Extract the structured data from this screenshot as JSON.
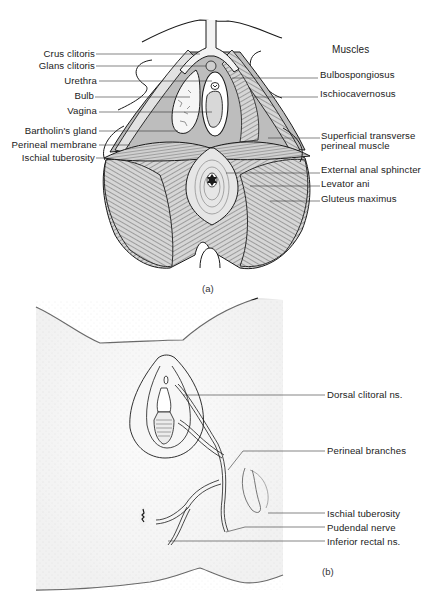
{
  "figure_a": {
    "caption": "(a)",
    "section_heading": "Muscles",
    "left_labels": [
      {
        "text": "Crus clitoris",
        "y": 52
      },
      {
        "text": "Glans clitoris",
        "y": 64
      },
      {
        "text": "Urethra",
        "y": 79
      },
      {
        "text": "Bulb",
        "y": 94
      },
      {
        "text": "Vagina",
        "y": 109
      },
      {
        "text": "Bartholin's gland",
        "y": 129
      },
      {
        "text": "Perineal membrane",
        "y": 143
      },
      {
        "text": "Ischial tuberosity",
        "y": 156
      }
    ],
    "right_labels": [
      {
        "text": "Bulbospongiosus",
        "y": 74
      },
      {
        "text": "Ischiocavernosus",
        "y": 93
      },
      {
        "text": "Superficial transverse",
        "y": 135
      },
      {
        "text": "perineal muscle",
        "y": 145
      },
      {
        "text": "External anal sphincter",
        "y": 168
      },
      {
        "text": "Levator ani",
        "y": 182
      },
      {
        "text": "Gluteus maximus",
        "y": 197
      }
    ]
  },
  "figure_b": {
    "caption": "(b)",
    "right_labels": [
      {
        "text": "Dorsal clitoral ns.",
        "y": 393
      },
      {
        "text": "Perineal branches",
        "y": 448
      },
      {
        "text": "Ischial tuberosity",
        "y": 509
      },
      {
        "text": "Pudendal nerve",
        "y": 524
      },
      {
        "text": "Inferior rectal ns.",
        "y": 539
      }
    ]
  },
  "colors": {
    "ink": "#1a1a1a",
    "muscle_fill": "#cfcfcf",
    "membrane_fill": "#b8b8b8",
    "skin_stipple": "#e4e4e4"
  }
}
